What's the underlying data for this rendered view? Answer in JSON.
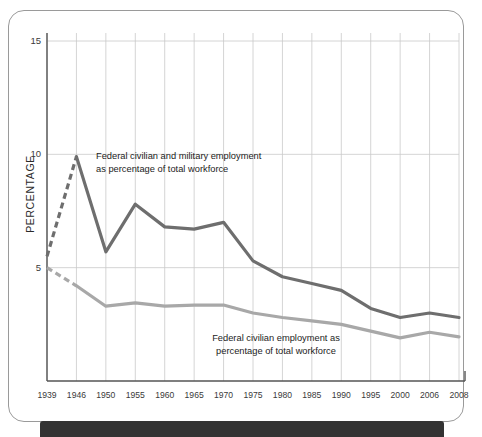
{
  "figure": {
    "background_color": "#ffffff",
    "frame_color": "#9a9a9a",
    "bottom_bar_color": "#333333"
  },
  "axis": {
    "y_label": "PERCENTAGE",
    "y_ticks": [
      "15",
      "10",
      "5"
    ],
    "x_ticks": [
      "1939",
      "1946",
      "1950",
      "1955",
      "1960",
      "1965",
      "1970",
      "1975",
      "1980",
      "1985",
      "1990",
      "1995",
      "2000",
      "2006",
      "2008"
    ]
  },
  "annotations": {
    "total": "Federal civilian and military employment\nas percentage of total workforce",
    "civilian": "Federal civilian employment as\npercentage of total workforce"
  },
  "chart_data": {
    "type": "line",
    "title": "",
    "xlabel": "",
    "ylabel": "PERCENTAGE",
    "ylim": [
      0,
      15
    ],
    "yticks": [
      5,
      10,
      15
    ],
    "grid": true,
    "legend": "inline-annotations",
    "x": [
      1939,
      1946,
      1950,
      1955,
      1960,
      1965,
      1970,
      1975,
      1980,
      1985,
      1990,
      1995,
      2000,
      2006,
      2008
    ],
    "series": [
      {
        "name": "Federal civilian and military employment as percentage of total workforce",
        "color": "#6e6e6e",
        "values": [
          5.5,
          9.9,
          5.7,
          7.8,
          6.8,
          6.7,
          7.0,
          5.3,
          4.6,
          4.3,
          4.0,
          3.2,
          2.8,
          3.0,
          2.8
        ],
        "dashed_segment_x": [
          1939,
          1946
        ],
        "dashed_note": "1939-1946 segment drawn dashed (estimated)"
      },
      {
        "name": "Federal civilian employment as percentage of total workforce",
        "color": "#a8a8a8",
        "values": [
          5.0,
          4.2,
          3.3,
          3.45,
          3.3,
          3.35,
          3.35,
          3.0,
          2.8,
          2.65,
          2.5,
          2.2,
          1.9,
          2.15,
          1.95
        ],
        "dashed_segment_x": [
          1939,
          1946
        ],
        "dashed_note": "1939-1946 segment drawn dashed (estimated)"
      }
    ]
  }
}
